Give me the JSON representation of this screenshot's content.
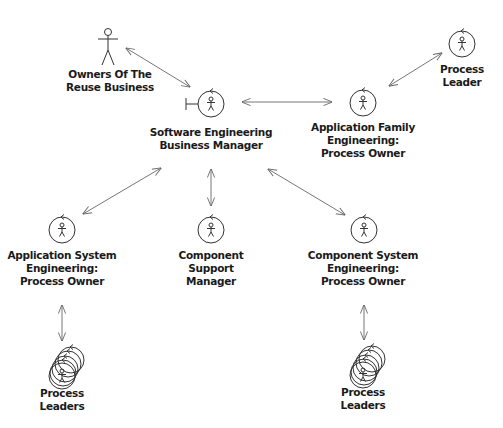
{
  "diagram": {
    "type": "business-use-case-worker-diagram",
    "nodes": [
      {
        "id": "owners",
        "kind": "actor",
        "label_lines": [
          "Owners Of The",
          "Reuse Business"
        ]
      },
      {
        "id": "sebm",
        "kind": "business-worker-boundary",
        "label_lines": [
          "Software Engineering",
          "Business Manager"
        ]
      },
      {
        "id": "afe",
        "kind": "business-worker",
        "label_lines": [
          "Application Family",
          "Engineering:",
          "Process Owner"
        ]
      },
      {
        "id": "pl",
        "kind": "business-worker",
        "label_lines": [
          "Process",
          "Leader"
        ]
      },
      {
        "id": "ase",
        "kind": "business-worker",
        "label_lines": [
          "Application System",
          "Engineering:",
          "Process Owner"
        ]
      },
      {
        "id": "csm",
        "kind": "business-worker",
        "label_lines": [
          "Component",
          "Support",
          "Manager"
        ]
      },
      {
        "id": "cse",
        "kind": "business-worker",
        "label_lines": [
          "Component System",
          "Engineering:",
          "Process Owner"
        ]
      },
      {
        "id": "pls_left",
        "kind": "business-worker-multiple",
        "label_lines": [
          "Process",
          "Leaders"
        ]
      },
      {
        "id": "pls_right",
        "kind": "business-worker-multiple",
        "label_lines": [
          "Process",
          "Leaders"
        ]
      }
    ],
    "edges": [
      {
        "from": "owners",
        "to": "sebm",
        "direction": "bidirectional"
      },
      {
        "from": "sebm",
        "to": "afe",
        "direction": "bidirectional"
      },
      {
        "from": "afe",
        "to": "pl",
        "direction": "bidirectional"
      },
      {
        "from": "sebm",
        "to": "ase",
        "direction": "bidirectional"
      },
      {
        "from": "sebm",
        "to": "csm",
        "direction": "bidirectional"
      },
      {
        "from": "sebm",
        "to": "cse",
        "direction": "bidirectional"
      },
      {
        "from": "ase",
        "to": "pls_left",
        "direction": "bidirectional"
      },
      {
        "from": "cse",
        "to": "pls_right",
        "direction": "bidirectional"
      }
    ],
    "icons": {
      "actor": "stick-figure-icon",
      "business-worker": "circle-with-figure-icon",
      "business-worker-boundary": "boundary-circle-with-figure-icon",
      "business-worker-multiple": "stacked-circles-with-figure-icon"
    }
  }
}
